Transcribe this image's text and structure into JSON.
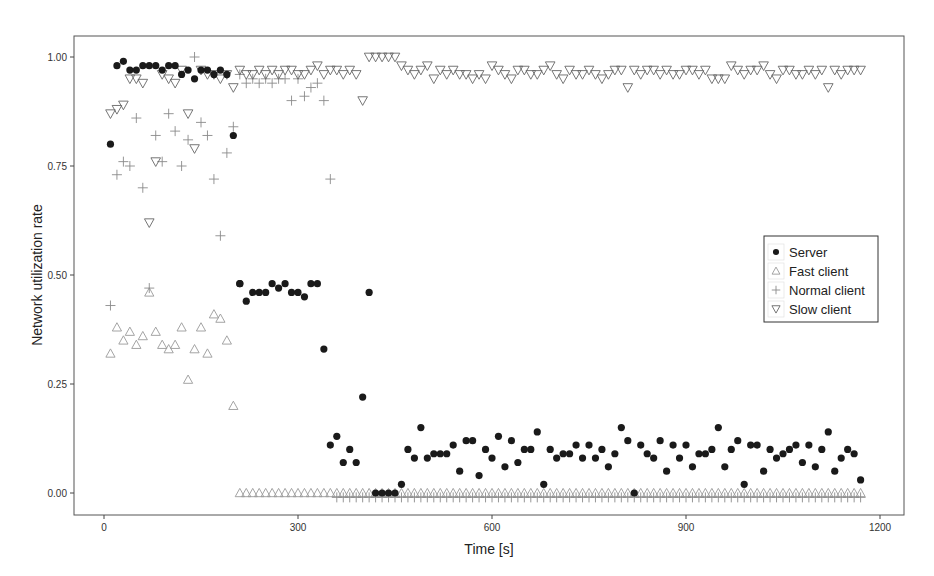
{
  "chart_data": {
    "type": "scatter",
    "title": "",
    "xlabel": "Time [s]",
    "ylabel": "Network utilization rate",
    "xlim": [
      -75,
      1230
    ],
    "ylim": [
      -0.05,
      1.05
    ],
    "xticks": [
      0,
      300,
      600,
      900,
      1200
    ],
    "xtick_labels": [
      "0",
      "300",
      "600",
      "900",
      "1200"
    ],
    "yticks": [
      0.0,
      0.25,
      0.5,
      0.75,
      1.0
    ],
    "ytick_labels": [
      "0.00",
      "0.25",
      "0.50",
      "0.75",
      "1.00"
    ],
    "grid": false,
    "legend_position": "right-center",
    "series": [
      {
        "name": "Server",
        "marker": "filled-circle",
        "color": "#1a1a1a",
        "x": [
          10,
          20,
          30,
          40,
          50,
          60,
          70,
          80,
          90,
          100,
          110,
          120,
          130,
          140,
          150,
          160,
          170,
          180,
          190,
          200,
          210,
          210,
          220,
          230,
          240,
          250,
          260,
          270,
          280,
          290,
          300,
          310,
          320,
          330,
          340,
          350,
          360,
          370,
          380,
          390,
          400,
          410,
          420,
          430,
          440,
          450,
          460,
          470,
          480,
          490,
          500,
          510,
          520,
          530,
          540,
          550,
          560,
          570,
          580,
          590,
          600,
          610,
          620,
          630,
          640,
          650,
          660,
          670,
          680,
          690,
          700,
          710,
          720,
          730,
          740,
          750,
          760,
          770,
          780,
          790,
          800,
          810,
          820,
          830,
          840,
          850,
          860,
          870,
          880,
          890,
          900,
          910,
          920,
          930,
          940,
          950,
          960,
          970,
          980,
          990,
          1000,
          1010,
          1020,
          1030,
          1040,
          1050,
          1060,
          1070,
          1080,
          1090,
          1100,
          1110,
          1120,
          1130,
          1140,
          1150,
          1160,
          1170
        ],
        "y": [
          0.8,
          0.98,
          0.99,
          0.97,
          0.97,
          0.98,
          0.98,
          0.98,
          0.97,
          0.98,
          0.98,
          0.96,
          0.97,
          0.95,
          0.97,
          0.97,
          0.96,
          0.97,
          0.96,
          0.82,
          0.48,
          0.48,
          0.44,
          0.46,
          0.46,
          0.46,
          0.48,
          0.47,
          0.48,
          0.46,
          0.46,
          0.45,
          0.48,
          0.48,
          0.33,
          0.11,
          0.13,
          0.07,
          0.1,
          0.07,
          0.22,
          0.46,
          0.0,
          0.0,
          0.0,
          0.0,
          0.02,
          0.1,
          0.08,
          0.15,
          0.08,
          0.09,
          0.09,
          0.09,
          0.11,
          0.05,
          0.12,
          0.12,
          0.04,
          0.1,
          0.08,
          0.13,
          0.06,
          0.12,
          0.07,
          0.1,
          0.1,
          0.14,
          0.02,
          0.1,
          0.08,
          0.09,
          0.09,
          0.11,
          0.08,
          0.11,
          0.08,
          0.1,
          0.06,
          0.09,
          0.15,
          0.12,
          0.0,
          0.11,
          0.09,
          0.08,
          0.12,
          0.05,
          0.11,
          0.08,
          0.11,
          0.06,
          0.09,
          0.09,
          0.1,
          0.15,
          0.06,
          0.1,
          0.12,
          0.02,
          0.11,
          0.11,
          0.05,
          0.1,
          0.08,
          0.09,
          0.1,
          0.11,
          0.07,
          0.11,
          0.06,
          0.1,
          0.14,
          0.05,
          0.08,
          0.1,
          0.09,
          0.03
        ]
      },
      {
        "name": "Fast client",
        "marker": "open-triangle-up",
        "color": "#9a9a9a",
        "x": [
          10,
          20,
          30,
          40,
          50,
          60,
          70,
          80,
          90,
          100,
          110,
          120,
          130,
          140,
          150,
          160,
          170,
          180,
          190,
          200,
          210,
          220,
          230,
          240,
          250,
          260,
          270,
          280,
          290,
          300,
          310,
          320,
          330,
          340,
          350,
          360,
          370,
          380,
          390,
          400,
          410,
          420,
          430,
          440,
          450,
          460,
          470,
          480,
          490,
          500,
          510,
          520,
          530,
          540,
          550,
          560,
          570,
          580,
          590,
          600,
          610,
          620,
          630,
          640,
          650,
          660,
          670,
          680,
          690,
          700,
          710,
          720,
          730,
          740,
          750,
          760,
          770,
          780,
          790,
          800,
          810,
          820,
          830,
          840,
          850,
          860,
          870,
          880,
          890,
          900,
          910,
          920,
          930,
          940,
          950,
          960,
          970,
          980,
          990,
          1000,
          1010,
          1020,
          1030,
          1040,
          1050,
          1060,
          1070,
          1080,
          1090,
          1100,
          1110,
          1120,
          1130,
          1140,
          1150,
          1160,
          1170
        ],
        "y": [
          0.32,
          0.38,
          0.35,
          0.37,
          0.34,
          0.36,
          0.46,
          0.37,
          0.34,
          0.33,
          0.34,
          0.38,
          0.26,
          0.33,
          0.38,
          0.32,
          0.41,
          0.4,
          0.35,
          0.2,
          0.0,
          0.0,
          0.0,
          0.0,
          0.0,
          0.0,
          0.0,
          0.0,
          0.0,
          0.0,
          0.0,
          0.0,
          0.0,
          0.0,
          0.0,
          0.0,
          0.0,
          0.0,
          0.0,
          0.0,
          0.0,
          0.0,
          0.0,
          0.0,
          0.0,
          0.0,
          0.0,
          0.0,
          0.0,
          0.0,
          0.0,
          0.0,
          0.0,
          0.0,
          0.0,
          0.0,
          0.0,
          0.0,
          0.0,
          0.0,
          0.0,
          0.0,
          0.0,
          0.0,
          0.0,
          0.0,
          0.0,
          0.0,
          0.0,
          0.0,
          0.0,
          0.0,
          0.0,
          0.0,
          0.0,
          0.0,
          0.0,
          0.0,
          0.0,
          0.0,
          0.0,
          0.0,
          0.0,
          0.0,
          0.0,
          0.0,
          0.0,
          0.0,
          0.0,
          0.0,
          0.0,
          0.0,
          0.0,
          0.0,
          0.0,
          0.0,
          0.0,
          0.0,
          0.0,
          0.0,
          0.0,
          0.0,
          0.0,
          0.0,
          0.0,
          0.0,
          0.0,
          0.0,
          0.0,
          0.0,
          0.0,
          0.0,
          0.0,
          0.0,
          0.0,
          0.0,
          0.0
        ]
      },
      {
        "name": "Normal client",
        "marker": "plus",
        "color": "#8a8a8a",
        "x": [
          10,
          20,
          30,
          40,
          50,
          60,
          70,
          80,
          90,
          100,
          110,
          120,
          130,
          140,
          150,
          160,
          170,
          180,
          190,
          200,
          210,
          220,
          230,
          240,
          250,
          260,
          270,
          280,
          290,
          300,
          310,
          320,
          330,
          340,
          350,
          360,
          370,
          380,
          390,
          400,
          410,
          420,
          430,
          440,
          450,
          460,
          470,
          480,
          490,
          500,
          510,
          520,
          530,
          540,
          550,
          560,
          570,
          580,
          590,
          600,
          610,
          620,
          630,
          640,
          650,
          660,
          670,
          680,
          690,
          700,
          710,
          720,
          730,
          740,
          750,
          760,
          770,
          780,
          790,
          800,
          810,
          820,
          830,
          840,
          850,
          860,
          870,
          880,
          890,
          900,
          910,
          920,
          930,
          940,
          950,
          960,
          970,
          980,
          990,
          1000,
          1010,
          1020,
          1030,
          1040,
          1050,
          1060,
          1070,
          1080,
          1090,
          1100,
          1110,
          1120,
          1130,
          1140,
          1150,
          1160,
          1170
        ],
        "y": [
          0.43,
          0.73,
          0.76,
          0.75,
          0.86,
          0.7,
          0.47,
          0.82,
          0.76,
          0.87,
          0.83,
          0.75,
          0.81,
          1.0,
          0.85,
          0.82,
          0.72,
          0.59,
          0.78,
          0.84,
          0.96,
          0.94,
          0.95,
          0.94,
          0.95,
          0.94,
          0.95,
          0.95,
          0.9,
          0.95,
          0.91,
          0.93,
          0.94,
          0.9,
          0.72,
          -0.01,
          -0.01,
          -0.01,
          -0.01,
          -0.01,
          -0.01,
          -0.01,
          -0.01,
          -0.01,
          -0.01,
          -0.01,
          -0.01,
          -0.01,
          -0.01,
          -0.01,
          -0.01,
          -0.01,
          -0.01,
          -0.01,
          -0.01,
          -0.01,
          -0.01,
          -0.01,
          -0.01,
          -0.01,
          -0.01,
          -0.01,
          -0.01,
          -0.01,
          -0.01,
          -0.01,
          -0.01,
          -0.01,
          -0.01,
          -0.01,
          -0.01,
          -0.01,
          -0.01,
          -0.01,
          -0.01,
          -0.01,
          -0.01,
          -0.01,
          -0.01,
          -0.01,
          -0.01,
          -0.01,
          -0.01,
          -0.01,
          -0.01,
          -0.01,
          -0.01,
          -0.01,
          -0.01,
          -0.01,
          -0.01,
          -0.01,
          -0.01,
          -0.01,
          -0.01,
          -0.01,
          -0.01,
          -0.01,
          -0.01,
          -0.01,
          -0.01,
          -0.01,
          -0.01,
          -0.01,
          -0.01,
          -0.01,
          -0.01,
          -0.01,
          -0.01,
          -0.01,
          -0.01,
          -0.01,
          -0.01,
          -0.01,
          -0.01,
          -0.01,
          -0.01
        ]
      },
      {
        "name": "Slow client",
        "marker": "open-triangle-down",
        "color": "#666666",
        "x": [
          10,
          20,
          30,
          40,
          50,
          60,
          70,
          80,
          90,
          100,
          110,
          120,
          130,
          140,
          150,
          160,
          170,
          180,
          190,
          200,
          210,
          220,
          230,
          240,
          250,
          260,
          270,
          280,
          290,
          300,
          310,
          320,
          330,
          340,
          350,
          360,
          370,
          380,
          390,
          400,
          410,
          420,
          430,
          440,
          450,
          460,
          470,
          480,
          490,
          500,
          510,
          520,
          530,
          540,
          550,
          560,
          570,
          580,
          590,
          600,
          610,
          620,
          630,
          640,
          650,
          660,
          670,
          680,
          690,
          700,
          710,
          720,
          730,
          740,
          750,
          760,
          770,
          780,
          790,
          800,
          810,
          820,
          830,
          840,
          850,
          860,
          870,
          880,
          890,
          900,
          910,
          920,
          930,
          940,
          950,
          960,
          970,
          980,
          990,
          1000,
          1010,
          1020,
          1030,
          1040,
          1050,
          1060,
          1070,
          1080,
          1090,
          1100,
          1110,
          1120,
          1130,
          1140,
          1150,
          1160,
          1170
        ],
        "y": [
          0.87,
          0.88,
          0.89,
          0.95,
          0.95,
          0.94,
          0.62,
          0.76,
          0.96,
          0.95,
          0.94,
          0.97,
          0.87,
          0.79,
          0.97,
          0.96,
          0.96,
          0.95,
          0.96,
          0.93,
          0.97,
          0.96,
          0.96,
          0.97,
          0.96,
          0.97,
          0.96,
          0.97,
          0.97,
          0.96,
          0.96,
          0.97,
          0.98,
          0.96,
          0.97,
          0.97,
          0.96,
          0.97,
          0.96,
          0.9,
          1.0,
          1.0,
          1.0,
          1.0,
          1.0,
          0.98,
          0.97,
          0.96,
          0.97,
          0.98,
          0.95,
          0.97,
          0.96,
          0.97,
          0.96,
          0.96,
          0.95,
          0.96,
          0.95,
          0.98,
          0.97,
          0.96,
          0.95,
          0.97,
          0.97,
          0.96,
          0.96,
          0.97,
          0.98,
          0.96,
          0.95,
          0.97,
          0.96,
          0.96,
          0.97,
          0.96,
          0.95,
          0.96,
          0.97,
          0.97,
          0.93,
          0.97,
          0.96,
          0.97,
          0.97,
          0.96,
          0.97,
          0.96,
          0.96,
          0.97,
          0.97,
          0.96,
          0.97,
          0.95,
          0.95,
          0.95,
          0.98,
          0.97,
          0.96,
          0.97,
          0.97,
          0.98,
          0.96,
          0.95,
          0.97,
          0.97,
          0.96,
          0.96,
          0.97,
          0.96,
          0.97,
          0.93,
          0.97,
          0.96,
          0.97,
          0.97,
          0.97
        ]
      }
    ]
  },
  "legend": {
    "items": [
      {
        "label": "Server",
        "marker": "filled-circle"
      },
      {
        "label": "Fast client",
        "marker": "open-triangle-up"
      },
      {
        "label": "Normal client",
        "marker": "plus"
      },
      {
        "label": "Slow client",
        "marker": "open-triangle-down"
      }
    ]
  },
  "axes": {
    "x_title": "Time [s]",
    "y_title": "Network utilization rate"
  }
}
